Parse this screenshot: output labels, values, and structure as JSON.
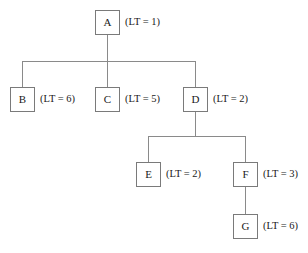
{
  "diagram": {
    "type": "tree",
    "colors": {
      "background": "#ffffff",
      "box_border": "#7a7a7a",
      "edge": "#8a8a8a",
      "text": "#1a1a1a"
    },
    "nodes": [
      {
        "id": "A",
        "letter": "A",
        "label": "(LT = 1)",
        "x": 95,
        "y": 10,
        "label_x": 125,
        "label_y": 17
      },
      {
        "id": "B",
        "letter": "B",
        "label": "(LT = 6)",
        "x": 10,
        "y": 87,
        "label_x": 40,
        "label_y": 94
      },
      {
        "id": "C",
        "letter": "C",
        "label": "(LT = 5)",
        "x": 95,
        "y": 87,
        "label_x": 125,
        "label_y": 94
      },
      {
        "id": "D",
        "letter": "D",
        "label": "(LT = 2)",
        "x": 183,
        "y": 87,
        "label_x": 213,
        "label_y": 94
      },
      {
        "id": "E",
        "letter": "E",
        "label": "(LT = 2)",
        "x": 136,
        "y": 162,
        "label_x": 166,
        "label_y": 169
      },
      {
        "id": "F",
        "letter": "F",
        "label": "(LT = 3)",
        "x": 233,
        "y": 162,
        "label_x": 263,
        "label_y": 169
      },
      {
        "id": "G",
        "letter": "G",
        "label": "(LT = 6)",
        "x": 233,
        "y": 214,
        "label_x": 263,
        "label_y": 221
      }
    ],
    "edges": [
      {
        "from": "A",
        "to": "B",
        "path": "M107.5,35 L107.5,61 M22,61 L195,61 M22,61 L22,87"
      },
      {
        "from": "A",
        "to": "C",
        "path": "M107.5,61 L107.5,87"
      },
      {
        "from": "A",
        "to": "D",
        "path": "M195,61 L195,87"
      },
      {
        "from": "D",
        "to": "E",
        "path": "M195,112 L195,136 M148,136 L245,136 M148,136 L148,162"
      },
      {
        "from": "D",
        "to": "F",
        "path": "M245,136 L245,162"
      },
      {
        "from": "F",
        "to": "G",
        "path": "M245.5,187 L245.5,214"
      }
    ]
  }
}
